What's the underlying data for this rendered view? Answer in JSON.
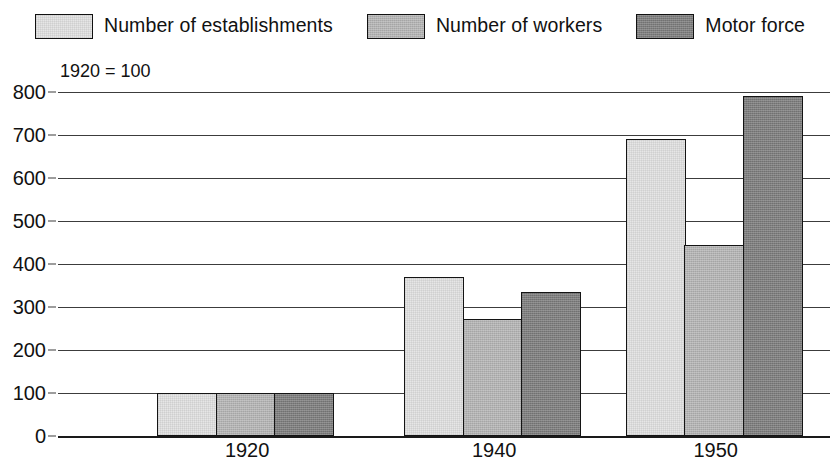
{
  "legend": {
    "position": "top-center",
    "items": [
      {
        "label": "Number of establishments",
        "swatch": "light-gray-swatch",
        "color": "#e6e6e6"
      },
      {
        "label": "Number of workers",
        "swatch": "medium-gray-swatch",
        "color": "#b2b2b2"
      },
      {
        "label": "Motor force",
        "swatch": "dark-gray-swatch",
        "color": "#7e7e7e"
      }
    ]
  },
  "annotation": {
    "text": "1920 = 100"
  },
  "axis": {
    "y_ticks": [
      "800",
      "700",
      "600",
      "500",
      "400",
      "300",
      "200",
      "100",
      "0"
    ],
    "x_ticks": [
      "1920",
      "1940",
      "1950"
    ]
  },
  "chart_data": {
    "type": "bar",
    "title": "",
    "subtitle": "",
    "xlabel": "",
    "ylabel": "",
    "annotation": "1920 = 100",
    "categories": [
      "1920",
      "1940",
      "1950"
    ],
    "series": [
      {
        "name": "Number of establishments",
        "color": "#e6e6e6",
        "values": [
          100,
          370,
          690
        ]
      },
      {
        "name": "Number of workers",
        "color": "#b2b2b2",
        "values": [
          100,
          272,
          445
        ]
      },
      {
        "name": "Motor force",
        "color": "#7e7e7e",
        "values": [
          100,
          335,
          790
        ]
      }
    ],
    "ylim": [
      0,
      800
    ],
    "ytick_step": 100,
    "ytick_values": [
      800,
      700,
      600,
      500,
      400,
      300,
      200,
      100,
      0
    ],
    "grid": "horizontal",
    "legend_position": "top"
  }
}
